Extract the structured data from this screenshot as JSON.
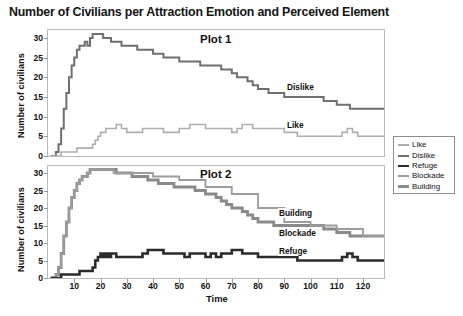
{
  "title": "Number of Civilians per Attraction Emotion and Perceived Element",
  "axes": {
    "ylabel": "Number of civilians",
    "xlabel": "Time",
    "yticks": [
      "0",
      "5",
      "10",
      "15",
      "20",
      "25",
      "30"
    ],
    "xticks": [
      "10",
      "20",
      "30",
      "40",
      "50",
      "60",
      "70",
      "80",
      "90",
      "100",
      "110",
      "120"
    ]
  },
  "panels": [
    {
      "name": "Plot 1",
      "inline_labels": [
        "Dislike",
        "Like"
      ]
    },
    {
      "name": "Plot 2",
      "inline_labels": [
        "Building",
        "Blockade",
        "Refuge"
      ]
    }
  ],
  "legend": {
    "items": [
      {
        "label": "Like",
        "color": "#aeaeae",
        "width": 1.6
      },
      {
        "label": "Dislike",
        "color": "#6f6f6f",
        "width": 2.0
      },
      {
        "label": "Refuge",
        "color": "#2b2b2b",
        "width": 2.6
      },
      {
        "label": "Blockade",
        "color": "#9c9c9c",
        "width": 1.8
      },
      {
        "label": "Building",
        "color": "#8a8a8a",
        "width": 2.8
      }
    ]
  },
  "chart_data": {
    "type": "line",
    "title": "Number of Civilians per Attraction Emotion and Perceived Element",
    "xlabel": "Time",
    "ylabel": "Number of civilians",
    "xlim": [
      0,
      128
    ],
    "ylim": [
      0,
      32
    ],
    "grid": false,
    "legend_position": "right",
    "subplots": [
      {
        "name": "Plot 1",
        "series": [
          {
            "name": "Dislike",
            "color": "#6f6f6f",
            "x": [
              1,
              2,
              3,
              4,
              5,
              6,
              7,
              8,
              9,
              10,
              11,
              12,
              13,
              14,
              15,
              16,
              17,
              18,
              19,
              20,
              21,
              22,
              23,
              24,
              25,
              26,
              27,
              28,
              29,
              30,
              32,
              34,
              36,
              38,
              40,
              42,
              44,
              46,
              48,
              50,
              52,
              54,
              56,
              58,
              60,
              62,
              64,
              66,
              68,
              70,
              72,
              74,
              76,
              78,
              80,
              82,
              84,
              86,
              88,
              90,
              92,
              95,
              100,
              105,
              110,
              115,
              120,
              125,
              128
            ],
            "y": [
              0,
              0,
              1,
              3,
              7,
              12,
              16,
              20,
              23,
              25,
              27,
              28,
              28,
              29,
              28,
              30,
              31,
              31,
              31,
              31,
              30,
              30,
              30,
              29,
              29,
              29,
              29,
              28,
              28,
              28,
              28,
              27,
              27,
              27,
              26,
              26,
              25,
              25,
              25,
              24,
              24,
              24,
              24,
              23,
              23,
              23,
              23,
              22,
              22,
              21,
              20,
              20,
              19,
              18,
              17,
              17,
              16,
              16,
              16,
              15,
              15,
              15,
              15,
              14,
              13,
              12,
              12,
              12,
              12
            ]
          },
          {
            "name": "Like",
            "color": "#aeaeae",
            "x": [
              1,
              2,
              3,
              4,
              5,
              6,
              7,
              8,
              9,
              10,
              11,
              12,
              13,
              14,
              15,
              16,
              17,
              18,
              19,
              20,
              22,
              24,
              26,
              28,
              30,
              32,
              34,
              36,
              38,
              40,
              42,
              44,
              46,
              48,
              50,
              52,
              54,
              56,
              58,
              60,
              62,
              64,
              66,
              68,
              70,
              72,
              74,
              76,
              78,
              80,
              82,
              84,
              86,
              88,
              90,
              95,
              100,
              105,
              110,
              112,
              114,
              116,
              118,
              120,
              125,
              128
            ],
            "y": [
              0,
              0,
              0,
              0,
              1,
              1,
              1,
              1,
              1,
              1,
              2,
              2,
              2,
              2,
              2,
              2,
              3,
              4,
              5,
              6,
              7,
              7,
              8,
              7,
              6,
              6,
              6,
              7,
              7,
              7,
              7,
              6,
              6,
              6,
              7,
              7,
              8,
              8,
              8,
              7,
              7,
              7,
              7,
              7,
              6,
              7,
              8,
              8,
              7,
              7,
              7,
              7,
              7,
              7,
              6,
              5,
              5,
              5,
              5,
              6,
              7,
              6,
              5,
              5,
              5,
              5
            ]
          }
        ]
      },
      {
        "name": "Plot 2",
        "series": [
          {
            "name": "Building",
            "color": "#8a8a8a",
            "x": [
              1,
              2,
              3,
              4,
              5,
              6,
              7,
              8,
              9,
              10,
              11,
              12,
              13,
              14,
              15,
              16,
              17,
              18,
              19,
              20,
              22,
              24,
              26,
              28,
              30,
              32,
              34,
              36,
              38,
              40,
              42,
              44,
              46,
              48,
              50,
              52,
              54,
              56,
              58,
              60,
              62,
              64,
              66,
              68,
              70,
              72,
              74,
              76,
              78,
              80,
              82,
              84,
              86,
              88,
              90,
              95,
              100,
              105,
              110,
              115,
              120,
              125,
              128
            ],
            "y": [
              0,
              0,
              1,
              3,
              7,
              12,
              16,
              20,
              23,
              25,
              27,
              28,
              29,
              29,
              30,
              31,
              31,
              31,
              31,
              31,
              31,
              31,
              30,
              30,
              30,
              29,
              29,
              29,
              28,
              28,
              27,
              27,
              27,
              26,
              26,
              26,
              26,
              25,
              25,
              24,
              24,
              23,
              22,
              21,
              20,
              20,
              19,
              18,
              17,
              16,
              16,
              16,
              15,
              15,
              15,
              15,
              15,
              14,
              13,
              12,
              12,
              12,
              12
            ]
          },
          {
            "name": "Blockade",
            "color": "#9c9c9c",
            "x": [
              1,
              2,
              3,
              4,
              5,
              6,
              7,
              8,
              9,
              10,
              11,
              12,
              13,
              14,
              15,
              16,
              17,
              18,
              19,
              20,
              25,
              30,
              40,
              50,
              60,
              70,
              80,
              90,
              100,
              110,
              120,
              128
            ],
            "y": [
              0,
              0,
              1,
              3,
              7,
              12,
              16,
              20,
              23,
              25,
              27,
              28,
              29,
              29,
              30,
              31,
              31,
              31,
              31,
              31,
              30,
              30,
              29,
              28,
              26,
              24,
              20,
              16,
              15,
              14,
              12,
              12
            ]
          },
          {
            "name": "Refuge",
            "color": "#2b2b2b",
            "x": [
              1,
              2,
              3,
              4,
              5,
              6,
              7,
              8,
              9,
              10,
              11,
              12,
              13,
              14,
              15,
              16,
              17,
              18,
              19,
              20,
              21,
              22,
              23,
              24,
              25,
              26,
              27,
              28,
              30,
              32,
              34,
              36,
              38,
              40,
              42,
              44,
              46,
              48,
              50,
              52,
              54,
              56,
              58,
              60,
              62,
              64,
              66,
              68,
              70,
              72,
              74,
              76,
              78,
              80,
              82,
              84,
              86,
              88,
              90,
              95,
              100,
              105,
              110,
              112,
              114,
              116,
              118,
              120,
              125,
              128
            ],
            "y": [
              0,
              0,
              0,
              0,
              1,
              1,
              1,
              1,
              1,
              1,
              1,
              2,
              2,
              2,
              2,
              2,
              3,
              5,
              6,
              7,
              6,
              7,
              6,
              7,
              7,
              6,
              6,
              6,
              6,
              6,
              6,
              7,
              8,
              8,
              8,
              7,
              7,
              7,
              7,
              6,
              7,
              7,
              7,
              6,
              7,
              6,
              7,
              7,
              8,
              8,
              7,
              7,
              7,
              6,
              6,
              6,
              6,
              6,
              6,
              5,
              5,
              5,
              5,
              6,
              7,
              6,
              5,
              5,
              5,
              5
            ]
          }
        ]
      }
    ]
  }
}
